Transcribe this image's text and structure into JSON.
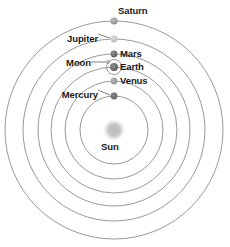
{
  "diagram": {
    "center": {
      "x": 114,
      "y": 130
    },
    "background_color": "#ffffff",
    "orbit_color": "#8c8c8c",
    "label_color": "#1a1a1a",
    "sun": {
      "label": "Sun",
      "cx": 114,
      "cy": 130,
      "radius": 9,
      "color": "#b0b0b0",
      "label_x": 101,
      "label_y": 141
    },
    "bodies": [
      {
        "name": "Mercury",
        "label": "Mercury",
        "orbit_radius": 34,
        "dot_x": 114,
        "dot_y": 96,
        "dot_radius": 3.4,
        "dot_color": "#6b6b6b",
        "label_side": "left",
        "label_x": 58,
        "label_y": 90
      },
      {
        "name": "Venus",
        "label": "Venus",
        "orbit_radius": 49,
        "dot_x": 114,
        "dot_y": 81,
        "dot_radius": 3.4,
        "dot_color": "#9a9a9a",
        "label_side": "right",
        "label_x": 120,
        "label_y": 75
      },
      {
        "name": "Earth",
        "label": "Earth",
        "orbit_radius": 63,
        "dot_x": 114,
        "dot_y": 67,
        "dot_radius": 4.0,
        "dot_color": "#6b6b6b",
        "label_side": "right",
        "label_x": 120,
        "label_y": 61
      },
      {
        "name": "Moon",
        "label": "Moon",
        "orbit_radius": 7.5,
        "dot_x": 108,
        "dot_y": 62,
        "dot_radius": 1.8,
        "dot_color": "#9a9a9a",
        "label_side": "left",
        "label_x": 64,
        "label_y": 60
      },
      {
        "name": "Mars",
        "label": "Mars",
        "orbit_radius": 76,
        "dot_x": 114,
        "dot_y": 54,
        "dot_radius": 3.4,
        "dot_color": "#6b6b6b",
        "label_side": "right",
        "label_x": 120,
        "label_y": 48
      },
      {
        "name": "Jupiter",
        "label": "Jupiter",
        "orbit_radius": 91,
        "dot_x": 114,
        "dot_y": 39,
        "dot_radius": 3.4,
        "dot_color": "#c2c2c2",
        "label_side": "left",
        "label_x": 61,
        "label_y": 33
      },
      {
        "name": "Saturn",
        "label": "Saturn",
        "orbit_radius": 109,
        "dot_x": 114,
        "dot_y": 21,
        "dot_radius": 3.6,
        "dot_color": "#9a9a9a",
        "label_side": "right",
        "label_x": 118,
        "label_y": 5
      }
    ],
    "orbit_radii": [
      34,
      49,
      63,
      76,
      91,
      109
    ]
  }
}
